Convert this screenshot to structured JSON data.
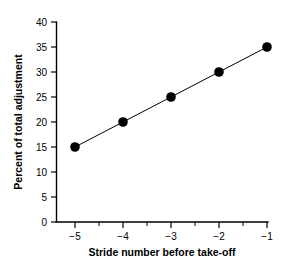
{
  "chart_data": {
    "type": "line",
    "title": "",
    "subtitle": "",
    "xlabel": "Stride number before take-off",
    "ylabel": "Percent of total adjustment",
    "x": [
      -5,
      -4,
      -3,
      -2,
      -1
    ],
    "values": [
      15,
      20,
      25,
      30,
      35
    ],
    "series": [
      {
        "name": "Percent of total adjustment",
        "x": [
          -5,
          -4,
          -3,
          -2,
          -1
        ],
        "values": [
          15,
          20,
          25,
          30,
          35
        ],
        "marker": "filled-circle",
        "color": "#000000"
      }
    ],
    "xlim": [
      -5.5,
      -0.85
    ],
    "ylim": [
      0,
      40
    ],
    "xticks": [
      -5,
      -4,
      -3,
      -2,
      -1
    ],
    "xtick_labels": [
      "−5",
      "−4",
      "−3",
      "−2",
      "−1"
    ],
    "x_minor_ticks": [
      -4.5,
      -3.5,
      -2.5,
      -1.5
    ],
    "yticks": [
      0,
      5,
      10,
      15,
      20,
      25,
      30,
      35,
      40
    ],
    "ytick_labels": [
      "0",
      "5",
      "10",
      "15",
      "20",
      "25",
      "30",
      "35",
      "40"
    ],
    "grid": false,
    "legend": null,
    "legend_position": "none",
    "annotations": [],
    "background_color": "#ffffff",
    "axis_color": "#000000",
    "line_color": "#000000",
    "marker_color": "#000000"
  }
}
